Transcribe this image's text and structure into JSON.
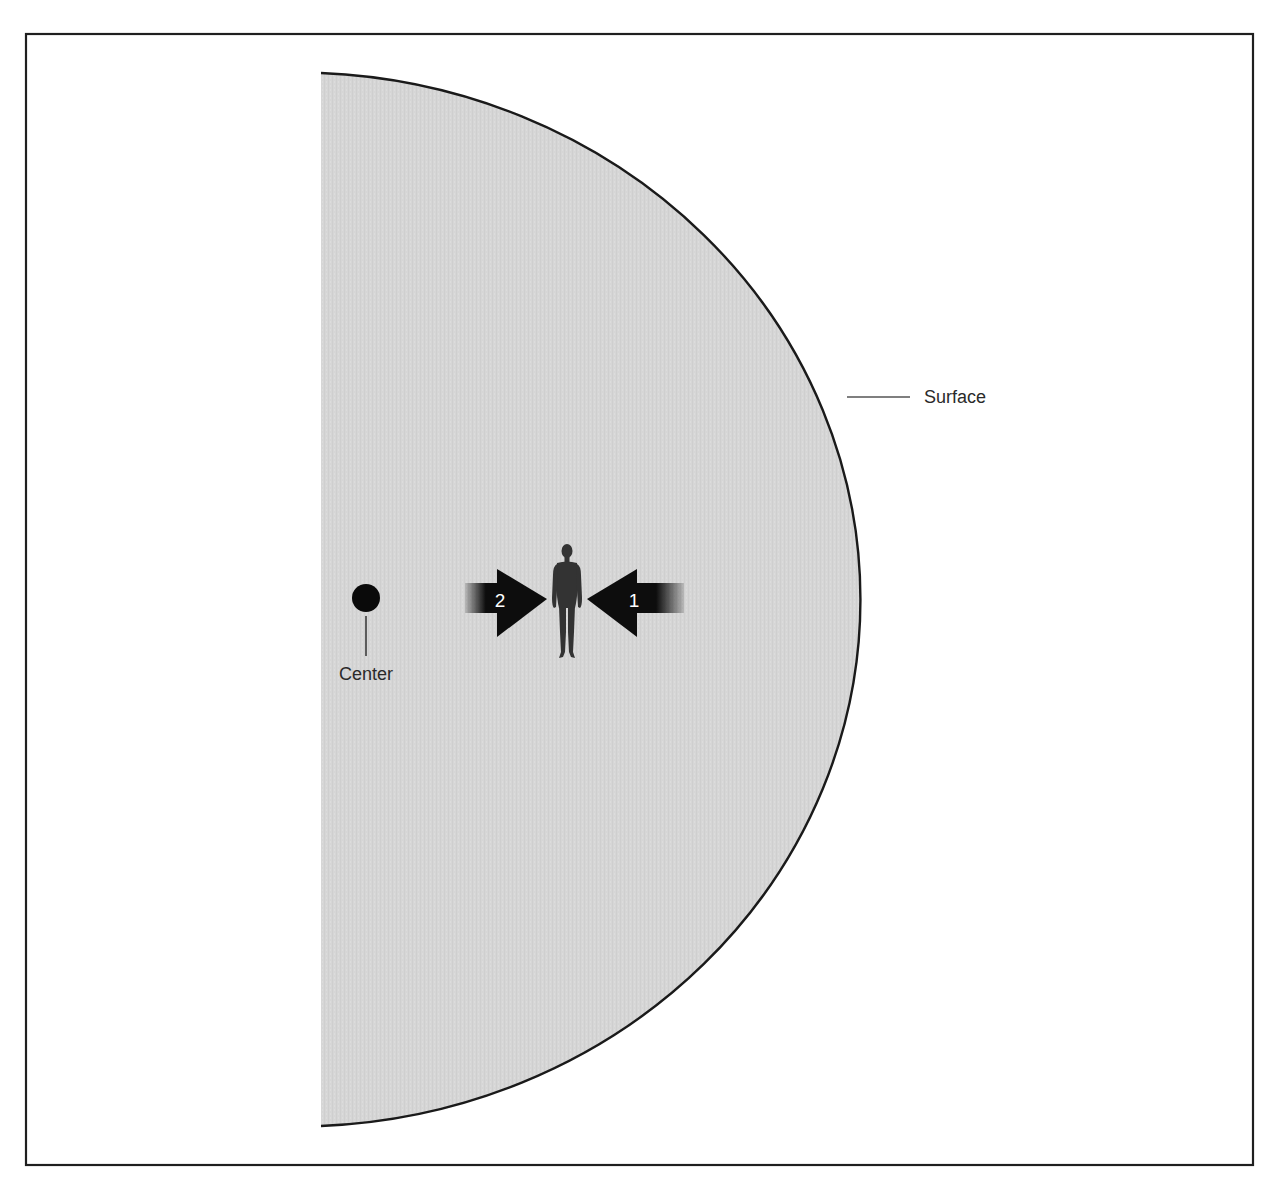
{
  "diagram": {
    "type": "planet-cross-section",
    "labels": {
      "center": "Center",
      "surface": "Surface"
    },
    "arrows": [
      {
        "number": "2",
        "direction": "right",
        "side": "toward-center"
      },
      {
        "number": "1",
        "direction": "left",
        "side": "toward-surface"
      }
    ],
    "colors": {
      "body_fill": "#d6d6d6",
      "outline": "#1a1a1a",
      "frame": "#1f1f1f",
      "arrow": "#0d0d0d",
      "figure": "#333333",
      "background": "#ffffff"
    },
    "icons": {
      "figure": "human-silhouette-icon",
      "center_marker": "center-dot-icon"
    }
  }
}
